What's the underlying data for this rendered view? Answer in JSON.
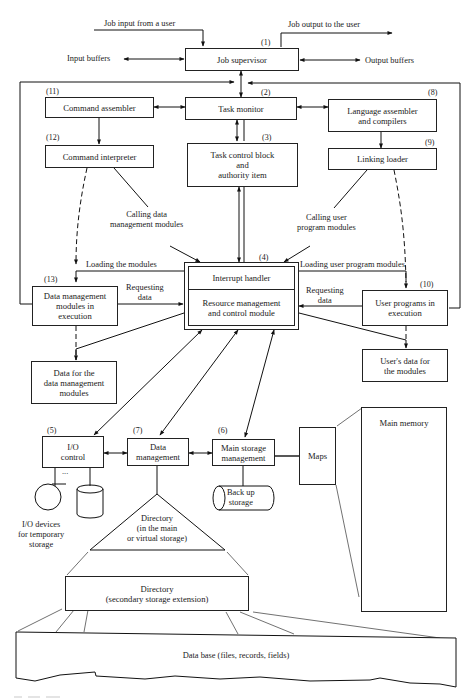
{
  "diagram": {
    "type": "operating-system-structure",
    "external_labels": {
      "job_input": "Job input from a user",
      "job_output": "Job output to the user",
      "input_buffers": "Input buffers",
      "output_buffers": "Output buffers"
    },
    "nodes": {
      "job_supervisor": {
        "num": "(1)",
        "label": "Job supervisor"
      },
      "task_monitor": {
        "num": "(2)",
        "label": "Task monitor"
      },
      "task_control_block": {
        "num": "(3)",
        "label": "Task control block\nand\nauthority item"
      },
      "interrupt_handler": {
        "num": "(4)",
        "label": "Interrupt handler"
      },
      "resource_management": {
        "label": "Resource management\nand control module"
      },
      "io_control": {
        "num": "(5)",
        "label": "I/O\ncontrol"
      },
      "main_storage_management": {
        "num": "(6)",
        "label": "Main storage\nmanagement"
      },
      "data_management": {
        "num": "(7)",
        "label": "Data\nmanagement"
      },
      "language_assembler": {
        "num": "(8)",
        "label": "Language assembler\nand compilers"
      },
      "linking_loader": {
        "num": "(9)",
        "label": "Linking loader"
      },
      "user_programs": {
        "num": "(10)",
        "label": "User programs in\nexecution"
      },
      "command_assembler": {
        "num": "(11)",
        "label": "Command  assembler"
      },
      "command_interpreter": {
        "num": "(12)",
        "label": "Command interpreter"
      },
      "data_mgmt_modules": {
        "num": "(13)",
        "label": "Data management\nmodules in\nexecution"
      },
      "data_for_dm_modules": {
        "label": "Data for the\ndata management\nmodules"
      },
      "users_data": {
        "label": "User's data for\nthe  modules"
      },
      "maps": {
        "label": "Maps"
      },
      "main_memory": {
        "label": "Main memory"
      },
      "backup_storage": {
        "label": "Back up\nstorage"
      },
      "io_devices": {
        "label": "I/O devices\nfor temporary\nstorage",
        "ellipsis": "..."
      },
      "directory_main": {
        "label": "Directory\n(in the main\nor virtual storage)"
      },
      "directory_secondary": {
        "label": "Directory\n(secondary storage extension)"
      },
      "database": {
        "label": "Data base (files, records, fields)"
      }
    },
    "edge_labels": {
      "calling_data_mgmt": "Calling data\nmanagement modules",
      "calling_user_prog": "Calling user\nprogram modules",
      "loading_modules": "Loading the modules",
      "loading_user_prog": "Loading user program modules",
      "requesting_data_left": "Requesting\ndata",
      "requesting_data_right": "Requesting\ndata"
    }
  }
}
